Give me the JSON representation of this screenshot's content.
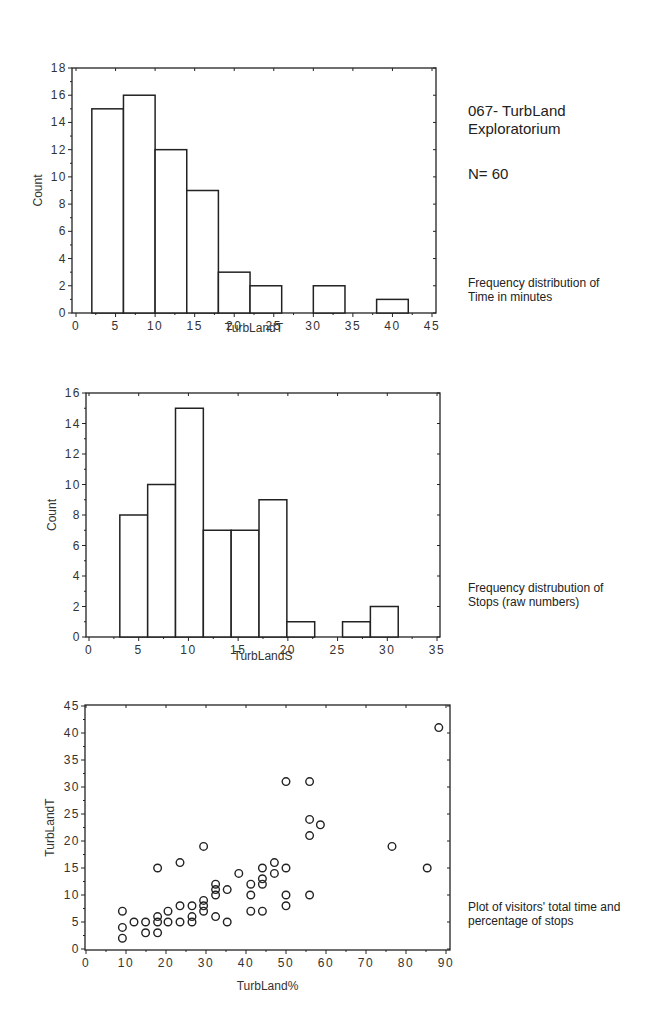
{
  "header": {
    "title_line1": "067- TurbLand",
    "title_line2": "Exploratorium",
    "n_label": "N= 60"
  },
  "captions": {
    "chart1_line1": "Frequency distribution of",
    "chart1_line2": "Time in minutes",
    "chart2_line1": "Frequency distrubution of",
    "chart2_line2": "Stops (raw numbers)",
    "chart3_line1": "Plot of visitors' total time and",
    "chart3_line2": "percentage of stops"
  },
  "chart_data": [
    {
      "type": "bar",
      "subtype": "histogram",
      "title": "",
      "xlabel": "TurbLandT",
      "ylabel": "Count",
      "xlim": [
        0,
        45
      ],
      "ylim": [
        0,
        18
      ],
      "xticks": [
        0,
        5,
        10,
        15,
        20,
        25,
        30,
        35,
        40,
        45
      ],
      "yticks": [
        0,
        2,
        4,
        6,
        8,
        10,
        12,
        14,
        16,
        18
      ],
      "bin_edges": [
        2,
        6,
        10,
        14,
        18,
        22,
        26,
        30,
        34,
        38,
        42
      ],
      "values": [
        15,
        16,
        12,
        9,
        3,
        2,
        0,
        2,
        0,
        1
      ],
      "grid": false
    },
    {
      "type": "bar",
      "subtype": "histogram",
      "title": "",
      "xlabel": "TurbLandS",
      "ylabel": "Count",
      "xlim": [
        0,
        35
      ],
      "ylim": [
        0,
        16
      ],
      "xticks": [
        0,
        5,
        10,
        15,
        20,
        25,
        30,
        35
      ],
      "yticks": [
        0,
        2,
        4,
        6,
        8,
        10,
        12,
        14,
        16
      ],
      "bin_edges": [
        3.1,
        5.9,
        8.7,
        11.5,
        14.3,
        17.1,
        19.9,
        22.7,
        25.5,
        28.3,
        31.1
      ],
      "values": [
        8,
        10,
        15,
        7,
        7,
        9,
        1,
        0,
        1,
        2
      ],
      "grid": false
    },
    {
      "type": "scatter",
      "title": "",
      "xlabel": "TurbLand%",
      "ylabel": "TurbLandT",
      "xlim": [
        0,
        90
      ],
      "ylim": [
        0,
        45
      ],
      "xticks": [
        0,
        10,
        20,
        30,
        40,
        50,
        60,
        70,
        80,
        90
      ],
      "yticks": [
        0,
        5,
        10,
        15,
        20,
        25,
        30,
        35,
        40,
        45
      ],
      "marker": "open-circle",
      "grid": false,
      "points": [
        [
          9.1,
          7
        ],
        [
          9.1,
          4
        ],
        [
          9.1,
          2
        ],
        [
          12,
          5
        ],
        [
          14.9,
          5
        ],
        [
          14.9,
          3
        ],
        [
          17.9,
          15
        ],
        [
          17.9,
          6
        ],
        [
          17.9,
          5
        ],
        [
          17.9,
          3
        ],
        [
          20.5,
          7
        ],
        [
          20.5,
          5
        ],
        [
          23.5,
          16
        ],
        [
          23.5,
          8
        ],
        [
          23.5,
          5
        ],
        [
          26.5,
          8
        ],
        [
          26.5,
          6
        ],
        [
          26.5,
          5
        ],
        [
          29.4,
          19
        ],
        [
          29.4,
          9
        ],
        [
          29.4,
          8
        ],
        [
          29.4,
          7
        ],
        [
          32.4,
          12
        ],
        [
          32.4,
          11
        ],
        [
          32.4,
          10
        ],
        [
          32.4,
          6
        ],
        [
          35.3,
          11
        ],
        [
          35.3,
          5
        ],
        [
          38.2,
          14
        ],
        [
          41.2,
          12
        ],
        [
          41.2,
          10
        ],
        [
          41.2,
          7
        ],
        [
          44.1,
          15
        ],
        [
          44.1,
          13
        ],
        [
          44.1,
          12
        ],
        [
          44.1,
          7
        ],
        [
          47.1,
          16
        ],
        [
          47.1,
          14
        ],
        [
          50,
          31
        ],
        [
          50,
          15
        ],
        [
          50,
          10
        ],
        [
          50,
          8
        ],
        [
          55.9,
          31
        ],
        [
          55.9,
          24
        ],
        [
          55.9,
          21
        ],
        [
          55.9,
          10
        ],
        [
          58.6,
          23
        ],
        [
          76.5,
          19
        ],
        [
          85.3,
          15
        ],
        [
          88.2,
          41
        ]
      ]
    }
  ]
}
